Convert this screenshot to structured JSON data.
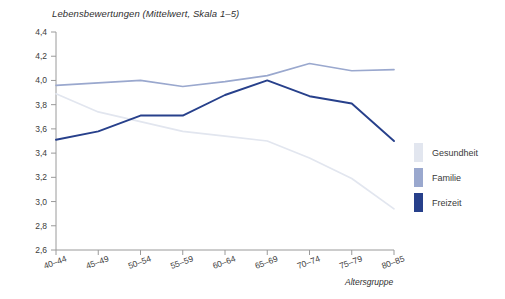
{
  "chart_data": {
    "type": "line",
    "title": "Lebensbewertungen (Mittelwert, Skala 1–5)",
    "xlabel": "Altersgruppe",
    "ylabel": "",
    "categories": [
      "40–44",
      "45–49",
      "50–54",
      "55–59",
      "60–64",
      "65–69",
      "70–74",
      "75–79",
      "80–85"
    ],
    "ylim": [
      2.6,
      4.4
    ],
    "yticks": [
      "2,6",
      "2,8",
      "3,0",
      "3,2",
      "3,4",
      "3,6",
      "3,8",
      "4,0",
      "4,2",
      "4,4"
    ],
    "ytick_values": [
      2.6,
      2.8,
      3.0,
      3.2,
      3.4,
      3.6,
      3.8,
      4.0,
      4.2,
      4.4
    ],
    "grid": false,
    "legend_position": "right",
    "series": [
      {
        "name": "Gesundheit",
        "color": "#e2e6ef",
        "values": [
          3.89,
          3.74,
          3.66,
          3.58,
          3.54,
          3.5,
          3.36,
          3.19,
          2.94
        ]
      },
      {
        "name": "Familie",
        "color": "#9aa8ce",
        "values": [
          3.96,
          3.98,
          4.0,
          3.95,
          3.99,
          4.04,
          4.14,
          4.08,
          4.09
        ]
      },
      {
        "name": "Freizeit",
        "color": "#27408b",
        "values": [
          3.51,
          3.58,
          3.71,
          3.71,
          3.88,
          4.0,
          3.87,
          3.81,
          3.5
        ]
      }
    ]
  },
  "legend": {
    "items": [
      {
        "label": "Gesundheit",
        "color": "#e2e6ef"
      },
      {
        "label": "Familie",
        "color": "#9aa8ce"
      },
      {
        "label": "Freizeit",
        "color": "#27408b"
      }
    ]
  },
  "axis": {
    "color": "#9a9a9a"
  }
}
